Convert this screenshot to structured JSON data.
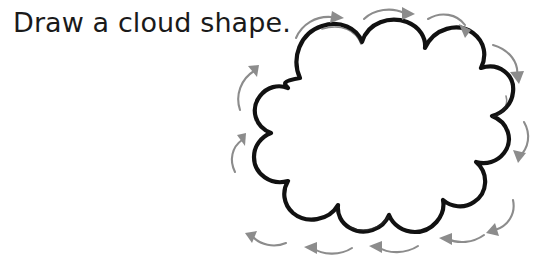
{
  "page": {
    "background_color": "#ffffff",
    "width": 542,
    "height": 262
  },
  "instruction": {
    "text": "Draw a cloud shape.",
    "color": "#1a1a1a"
  },
  "drawing": {
    "shape_name": "cloud",
    "outline_color": "#111111",
    "fill_color": "#ffffff",
    "stroke_style": "hand-drawn",
    "arrow_color": "#8c8c8c",
    "arrow_direction": "clockwise",
    "arrow_count": 12,
    "arrows": [
      {
        "id": "top-left",
        "points": "right"
      },
      {
        "id": "top-center",
        "points": "right"
      },
      {
        "id": "top-right",
        "points": "right"
      },
      {
        "id": "right-upper",
        "points": "down"
      },
      {
        "id": "right-middle",
        "points": "down"
      },
      {
        "id": "right-lower",
        "points": "down"
      },
      {
        "id": "bottom-right",
        "points": "left"
      },
      {
        "id": "bottom-center-right",
        "points": "left"
      },
      {
        "id": "bottom-center-left",
        "points": "left"
      },
      {
        "id": "bottom-left",
        "points": "left"
      },
      {
        "id": "left-lower",
        "points": "up"
      },
      {
        "id": "left-upper",
        "points": "up"
      }
    ]
  }
}
